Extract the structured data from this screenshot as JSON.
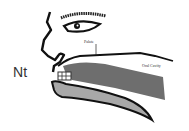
{
  "diagram": {
    "title_label": "Nt",
    "labels": {
      "palate": "Palate",
      "oral_cavity": "Oral Cavity"
    },
    "colors": {
      "outline": "#1a1a1a",
      "tongue_upper": "#6e6e6e",
      "tongue_lower": "#a8a8a8",
      "background": "#ffffff"
    }
  }
}
